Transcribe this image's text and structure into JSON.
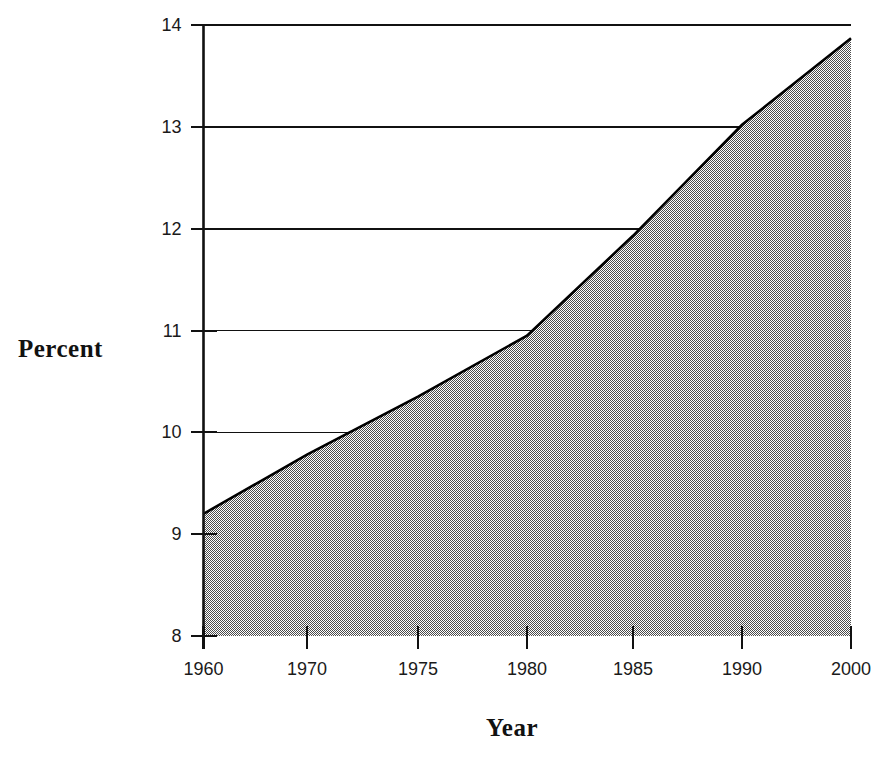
{
  "chart_data": {
    "type": "area",
    "title": "",
    "subtitle": "",
    "xlabel": "Year",
    "ylabel": "Percent",
    "x": [
      1960,
      1970,
      1975,
      1980,
      1985,
      1990,
      2000
    ],
    "xtick_labels": [
      "1960",
      "1970",
      "1975",
      "1980",
      "1985",
      "1990",
      "2000"
    ],
    "ytick_labels": [
      "8",
      "9",
      "10",
      "11",
      "12",
      "13",
      "14"
    ],
    "ytick_values": [
      8,
      9,
      10,
      11,
      12,
      13,
      14
    ],
    "series": [
      {
        "name": "Percent",
        "values": [
          9.2,
          9.78,
          10.35,
          10.95,
          11.93,
          13.02,
          13.87
        ]
      }
    ],
    "xlim": [
      1960,
      2000
    ],
    "ylim": [
      8,
      14
    ],
    "grid": "horizontal-clipped-to-curve",
    "legend": "none",
    "fill_color": "#808080",
    "fill_pattern": "50-percent-checkerboard-dither",
    "line_color": "#000000",
    "axis_color": "#000000",
    "background_color": "#ffffff",
    "x_axis_spacing": "categorical"
  },
  "axes": {
    "y_title": "Percent",
    "x_title": "Year"
  }
}
